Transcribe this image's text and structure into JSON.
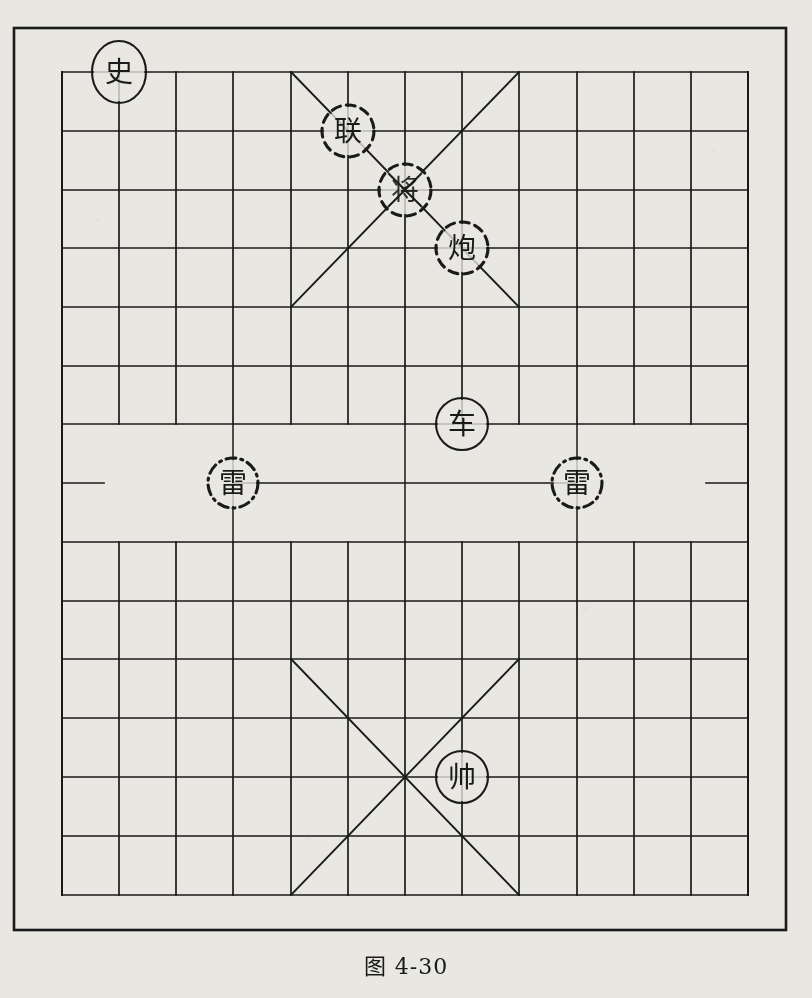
{
  "figure": {
    "caption": "图 4-30",
    "kind": "xiangqi-board-diagram",
    "background_color": "#e9e7e2",
    "line_color": "#1a1a1a"
  },
  "board": {
    "outer_frame": {
      "x": 14,
      "y": 28,
      "width": 772,
      "height": 902
    },
    "grid": {
      "left": 62,
      "right": 748,
      "columns": 13,
      "column_xs": [
        62,
        119,
        176,
        233,
        291,
        348,
        405,
        462,
        519,
        577,
        634,
        691,
        748
      ],
      "top_rows_ys": [
        72,
        131,
        190,
        248,
        307,
        366,
        424
      ],
      "river_y": 483,
      "bottom_rows_ys": [
        542,
        601,
        659,
        718,
        777,
        836,
        895
      ]
    },
    "palaces": [
      {
        "name": "top-palace",
        "x1": 291,
        "y1": 72,
        "x2": 519,
        "y2": 307,
        "center_x": 405,
        "center_y": 190
      },
      {
        "name": "bottom-palace",
        "x1": 291,
        "y1": 659,
        "x2": 519,
        "y2": 895,
        "center_x": 405,
        "center_y": 777
      }
    ],
    "river": {
      "line_y": 483,
      "left_stub": {
        "x1": 62,
        "x2": 104
      },
      "right_stub": {
        "x1": 706,
        "x2": 748
      },
      "span": {
        "x1": 233,
        "x2": 577
      },
      "verticals": [
        {
          "x": 233,
          "y1": 424,
          "y2": 542
        },
        {
          "x": 405,
          "y1": 424,
          "y2": 542
        },
        {
          "x": 577,
          "y1": 424,
          "y2": 542
        }
      ]
    }
  },
  "pieces": [
    {
      "id": "piece-shi",
      "label": "史",
      "x": 119,
      "y": 72,
      "style": "solid",
      "rx": 27,
      "ry": 31
    },
    {
      "id": "piece-lian",
      "label": "联",
      "x": 348,
      "y": 131,
      "style": "dashed",
      "rx": 26,
      "ry": 26
    },
    {
      "id": "piece-jiang",
      "label": "将",
      "x": 405,
      "y": 190,
      "style": "dashed",
      "rx": 26,
      "ry": 26,
      "obscured": true
    },
    {
      "id": "piece-pao",
      "label": "炮",
      "x": 462,
      "y": 248,
      "style": "dashed",
      "rx": 26,
      "ry": 26
    },
    {
      "id": "piece-ju",
      "label": "车",
      "x": 462,
      "y": 424,
      "style": "solid",
      "rx": 26,
      "ry": 26
    },
    {
      "id": "piece-lei-left",
      "label": "雷",
      "x": 233,
      "y": 483,
      "style": "dashdot",
      "rx": 25,
      "ry": 25
    },
    {
      "id": "piece-lei-right",
      "label": "雷",
      "x": 577,
      "y": 483,
      "style": "dashdot",
      "rx": 25,
      "ry": 25
    },
    {
      "id": "piece-shuai",
      "label": "帅",
      "x": 462,
      "y": 777,
      "style": "solid",
      "rx": 26,
      "ry": 26
    }
  ]
}
